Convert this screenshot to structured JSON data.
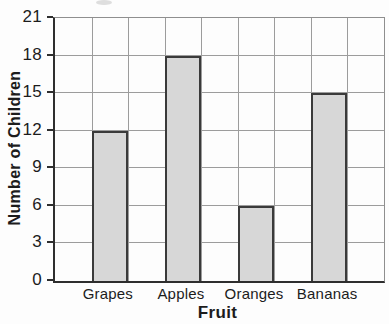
{
  "chart_data": {
    "type": "bar",
    "title": "",
    "xlabel": "Fruit",
    "ylabel": "Number of Children",
    "categories": [
      "Grapes",
      "Apples",
      "Oranges",
      "Bananas"
    ],
    "values": [
      12,
      18,
      6,
      15
    ],
    "ylim": [
      0,
      21
    ],
    "yticks": [
      0,
      3,
      6,
      9,
      12,
      15,
      18,
      21
    ],
    "grid": "both",
    "legend": "none",
    "colors": {
      "background": "#fdfdfd",
      "bar_fill": "#d7d7d7",
      "bar_border": "#3a3a3a",
      "gridline": "#9c9c9c",
      "grid_edge": "#8f8f8f",
      "axis": "#2e2e2e",
      "text": "#1c1c1c"
    }
  }
}
